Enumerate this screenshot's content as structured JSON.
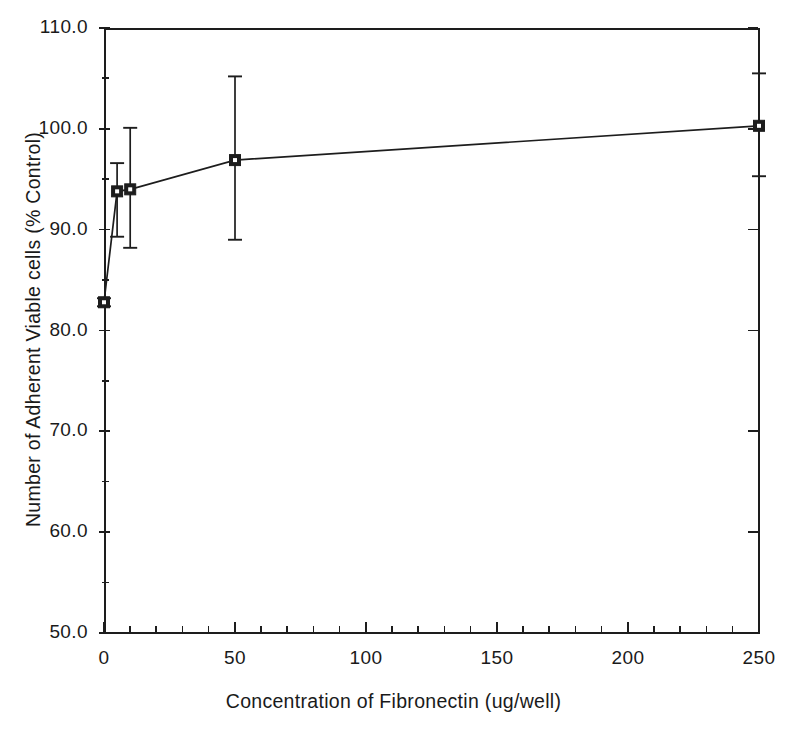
{
  "chart_data": {
    "type": "line",
    "title": "",
    "xlabel": "Concentration of Fibronectin (ug/well)",
    "ylabel": "Number of Adherent Viable cells (% Control)",
    "xlim": [
      0,
      250
    ],
    "ylim": [
      50.0,
      110.0
    ],
    "grid": false,
    "legend": "none",
    "xticks": [
      0,
      50,
      100,
      150,
      200,
      250
    ],
    "xtick_labels": [
      "0",
      "50",
      "100",
      "150",
      "200",
      "250"
    ],
    "xtick_minor_step": 10,
    "yticks": [
      50.0,
      60.0,
      70.0,
      80.0,
      90.0,
      100.0,
      110.0
    ],
    "ytick_labels": [
      "50.0",
      "60.0",
      "70.0",
      "80.0",
      "90.0",
      "100.0",
      "110.0"
    ],
    "ytick_minor": [
      55.0,
      65.0,
      75.0,
      85.0,
      95.0,
      105.0
    ],
    "marker": "filled-square",
    "series": [
      {
        "name": "Adherent viable cells",
        "x": [
          0,
          5,
          10,
          50,
          250
        ],
        "values": [
          82.8,
          93.8,
          94.0,
          96.9,
          100.3
        ],
        "err_upper": [
          0.4,
          2.8,
          6.1,
          8.3,
          5.2
        ],
        "err_lower": [
          0.4,
          4.5,
          5.8,
          7.9,
          5.0
        ]
      }
    ]
  },
  "figure": {
    "axis_color": "#1d1d1d",
    "series_color": "#1d1d1d",
    "background": "#ffffff"
  }
}
